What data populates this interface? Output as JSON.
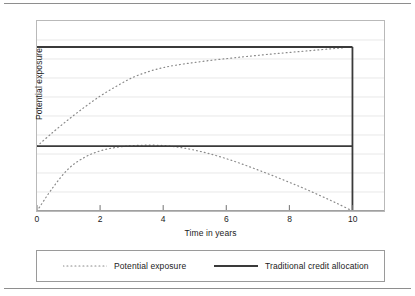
{
  "figure": {
    "has_top_rule": true,
    "has_bottom_rule": true
  },
  "axes": {
    "x_label": "Time in years",
    "y_label": "Potential exposure",
    "x_ticks": [
      "0",
      "2",
      "4",
      "6",
      "8",
      "10"
    ],
    "y_ticks": []
  },
  "legend": {
    "entries": [
      {
        "label": "Potential exposure",
        "style": "dotted",
        "color": "#8a8a8a"
      },
      {
        "label": "Traditional credit allocation",
        "style": "solid",
        "color": "#3a3a3a"
      }
    ]
  },
  "colors": {
    "frame": "#b9b9b9",
    "gridline": "#e6e6e6",
    "dotted_series": "#8a8a8a",
    "solid_series": "#3a3a3a",
    "text": "#1b1b1b",
    "page_rule": "#8e8e8e"
  },
  "chart_data": {
    "type": "line",
    "title": "",
    "xlabel": "Time in years",
    "ylabel": "Potential exposure",
    "xlim": [
      0,
      11
    ],
    "ylim": [
      0,
      1.1
    ],
    "grid": true,
    "grid_axis": "y",
    "legend_position": "below",
    "x": [
      0,
      0.5,
      1,
      1.5,
      2,
      2.5,
      3,
      3.5,
      4,
      4.5,
      5,
      5.5,
      6,
      6.5,
      7,
      7.5,
      8,
      8.5,
      9,
      9.5,
      10
    ],
    "series": [
      {
        "name": "Potential exposure",
        "sublabel": "upper / swap-like profile",
        "style": "dotted",
        "color": "#8a8a8a",
        "values": [
          0.375,
          0.455,
          0.53,
          0.6,
          0.665,
          0.72,
          0.77,
          0.805,
          0.83,
          0.847,
          0.86,
          0.872,
          0.882,
          0.892,
          0.901,
          0.91,
          0.918,
          0.926,
          0.934,
          0.942,
          0.95
        ]
      },
      {
        "name": "Potential exposure",
        "sublabel": "lower / amortising profile",
        "style": "dotted",
        "color": "#8a8a8a",
        "values": [
          0.0,
          0.135,
          0.245,
          0.31,
          0.348,
          0.368,
          0.378,
          0.381,
          0.379,
          0.369,
          0.352,
          0.33,
          0.303,
          0.272,
          0.238,
          0.203,
          0.166,
          0.128,
          0.087,
          0.045,
          0.0
        ]
      },
      {
        "name": "Traditional credit allocation",
        "sublabel": "upper constant limit",
        "style": "solid",
        "color": "#3a3a3a",
        "values": [
          0.95,
          0.95,
          0.95,
          0.95,
          0.95,
          0.95,
          0.95,
          0.95,
          0.95,
          0.95,
          0.95,
          0.95,
          0.95,
          0.95,
          0.95,
          0.95,
          0.95,
          0.95,
          0.95,
          0.95,
          0.95
        ]
      },
      {
        "name": "Traditional credit allocation",
        "sublabel": "lower constant limit",
        "style": "solid",
        "color": "#3a3a3a",
        "values": [
          0.375,
          0.375,
          0.375,
          0.375,
          0.375,
          0.375,
          0.375,
          0.375,
          0.375,
          0.375,
          0.375,
          0.375,
          0.375,
          0.375,
          0.375,
          0.375,
          0.375,
          0.375,
          0.375,
          0.375,
          0.375
        ]
      }
    ],
    "annotations": [
      {
        "kind": "vertical-drop-line",
        "x": 10,
        "y_from": 0.0,
        "y_to": 0.95,
        "style": "solid",
        "color": "#3a3a3a"
      }
    ],
    "gridlines_y": [
      0.11,
      0.22,
      0.33,
      0.44,
      0.55,
      0.66,
      0.77,
      0.88,
      0.99
    ]
  }
}
